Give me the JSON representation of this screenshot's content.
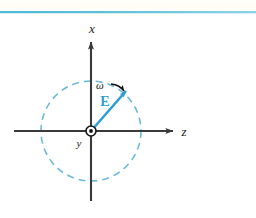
{
  "figure": {
    "background_color": "#ffffff",
    "width": 256,
    "height": 218
  },
  "top_rule": {
    "name": "top-rule",
    "color": "#5fc2da",
    "y": 11,
    "thickness": 2
  },
  "axes": {
    "origin": {
      "x": 91,
      "y": 131
    },
    "vertical": {
      "label": "x",
      "label_x": 92,
      "label_y": 33,
      "x": 91,
      "y_top": 38,
      "y_bottom": 201,
      "color": "#3a3a3a",
      "arrow": "up"
    },
    "horizontal": {
      "label": "z",
      "label_x": 184,
      "label_y": 136,
      "y": 131,
      "x_left": 14,
      "x_right": 177,
      "color": "#3a3a3a",
      "arrow": "right"
    },
    "out_of_page": {
      "label": "y",
      "label_x": 79,
      "label_y": 147,
      "symbol": "circle-dot-icon",
      "radius": 5,
      "dot_radius": 2,
      "color": "#1a1a1a"
    }
  },
  "circle": {
    "name": "polarization-circle",
    "center_x": 91,
    "center_y": 131,
    "radius": 50,
    "color": "#6bb9dc",
    "dash": "7 5",
    "stroke_width": 1.6
  },
  "field_vector": {
    "label": "E",
    "label_x": 100,
    "label_y": 105,
    "color": "#2e9ed2",
    "stroke_width": 2.6,
    "from_x": 91,
    "from_y": 131,
    "to_x": 129,
    "to_y": 88,
    "angle_deg": 48
  },
  "rotation": {
    "label": "ω",
    "label_x": 100,
    "label_y": 89,
    "arrow_color": "#141414",
    "arrow_start_x": 112,
    "arrow_start_y": 85,
    "arrow_end_x": 126,
    "arrow_end_y": 92,
    "direction": "clockwise-toward-vector-tip"
  },
  "colors": {
    "accent_blue": "#2e9ed2",
    "circle_blue": "#6bb9dc",
    "rule_blue": "#5fc2da",
    "axis_gray": "#3a3a3a",
    "ink_black": "#141414"
  }
}
